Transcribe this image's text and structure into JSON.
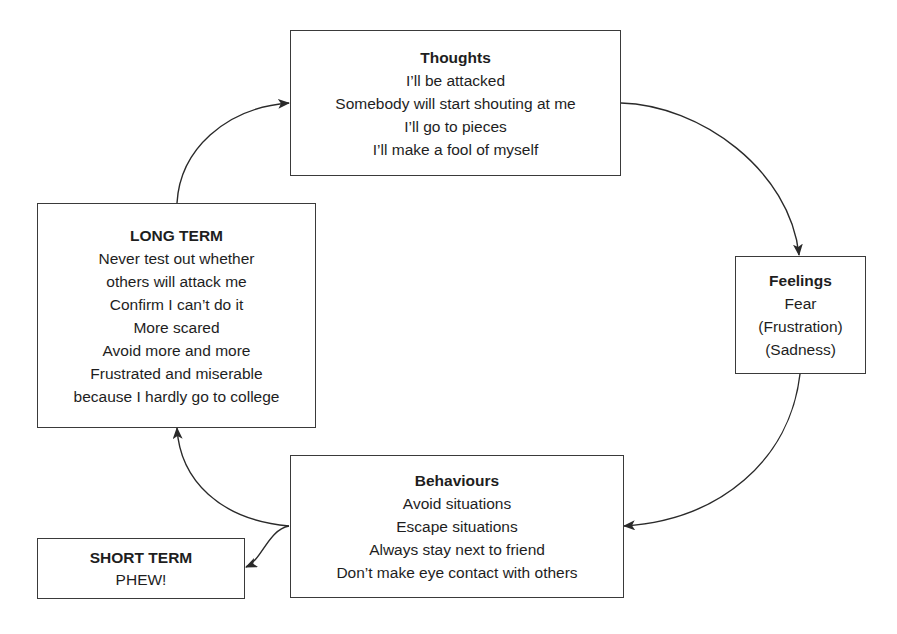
{
  "diagram": {
    "type": "cycle",
    "nodes": {
      "thoughts": {
        "title": "Thoughts",
        "lines": [
          "I’ll be attacked",
          "Somebody will start shouting at me",
          "I’ll go to pieces",
          "I’ll make a fool of myself"
        ]
      },
      "feelings": {
        "title": "Feelings",
        "lines": [
          "Fear",
          "(Frustration)",
          "(Sadness)"
        ]
      },
      "behaviours": {
        "title": "Behaviours",
        "lines": [
          "Avoid situations",
          "Escape situations",
          "Always stay next to friend",
          "Don’t make eye contact with others"
        ]
      },
      "long_term": {
        "title": "LONG TERM",
        "lines": [
          "Never test out whether",
          "others will attack me",
          "Confirm I can’t do it",
          "More scared",
          "Avoid more and more",
          "Frustrated and miserable",
          "because I hardly go to college"
        ]
      },
      "short_term": {
        "title": "SHORT TERM",
        "lines": [
          "PHEW!"
        ]
      }
    },
    "edges": [
      {
        "from": "thoughts",
        "to": "feelings"
      },
      {
        "from": "feelings",
        "to": "behaviours"
      },
      {
        "from": "behaviours",
        "to": "long_term"
      },
      {
        "from": "behaviours",
        "to": "short_term"
      },
      {
        "from": "long_term",
        "to": "thoughts"
      }
    ],
    "colors": {
      "line": "#2a2a2a",
      "text": "#1e1e1e",
      "background": "#ffffff"
    }
  }
}
